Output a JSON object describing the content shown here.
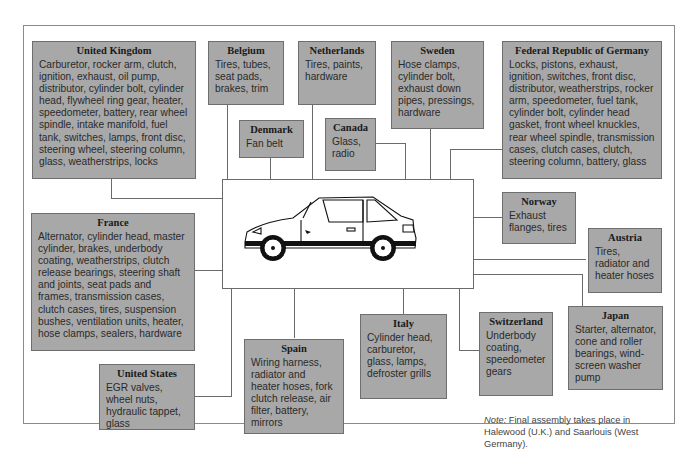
{
  "diagram": {
    "type": "supplier-map",
    "center": "car-illustration",
    "countries": [
      {
        "id": "uk",
        "name": "United Kingdom",
        "parts": "Carburetor, rocker arm, clutch, ignition, exhaust, oil pump, distributor, cylinder bolt, cylinder head, flywheel ring gear, heater, speedometer, battery, rear wheel spindle, intake manifold, fuel tank, switches, lamps, front disc, steering wheel, steering column, glass, weatherstrips, locks"
      },
      {
        "id": "belgium",
        "name": "Belgium",
        "parts": "Tires, tubes, seat pads, brakes, trim"
      },
      {
        "id": "netherlands",
        "name": "Netherlands",
        "parts": "Tires, paints, hardware"
      },
      {
        "id": "sweden",
        "name": "Sweden",
        "parts": "Hose clamps, cylinder bolt, exhaust down pipes, pressings, hardware"
      },
      {
        "id": "germany",
        "name": "Federal Republic of Germany",
        "parts": "Locks, pistons, exhaust, ignition, switches, front disc, distributor, weatherstrips, rocker arm, speedometer, fuel tank, cylinder bolt, cylinder head gasket, front wheel knuckles, rear wheel spindle, transmission cases, clutch cases, clutch, steering column, battery, glass"
      },
      {
        "id": "denmark",
        "name": "Denmark",
        "parts": "Fan belt"
      },
      {
        "id": "canada",
        "name": "Canada",
        "parts": "Glass, radio"
      },
      {
        "id": "norway",
        "name": "Norway",
        "parts": "Exhaust flanges, tires"
      },
      {
        "id": "austria",
        "name": "Austria",
        "parts": "Tires, radiator and heater hoses"
      },
      {
        "id": "france",
        "name": "France",
        "parts": "Alternator, cylinder head, master cylinder, brakes, underbody coating, weatherstrips, clutch release bearings, steering shaft and joints, seat pads and frames, transmission cases, clutch cases, tires, suspension bushes, ventilation units, heater, hose clamps, sealers, hardware"
      },
      {
        "id": "us",
        "name": "United States",
        "parts": "EGR valves, wheel nuts, hydraulic tappet, glass"
      },
      {
        "id": "spain",
        "name": "Spain",
        "parts": "Wiring harness, radiator and heater hoses, fork clutch release, air filter, battery, mirrors"
      },
      {
        "id": "italy",
        "name": "Italy",
        "parts": "Cylinder head, carburetor, glass, lamps, defroster grills"
      },
      {
        "id": "switzerland",
        "name": "Switzerland",
        "parts": "Underbody coating, speedometer gears"
      },
      {
        "id": "japan",
        "name": "Japan",
        "parts": "Starter, alternator, cone and roller bearings, wind-screen washer pump"
      }
    ],
    "note_label": "Note:",
    "note_text": " Final assembly takes place in Halewood (U.K.) and Saarlouis (West Germany).",
    "colors": {
      "box_fill": "#a8a8a8",
      "box_border": "#6e6e6e",
      "line": "#6a6a6a"
    }
  }
}
